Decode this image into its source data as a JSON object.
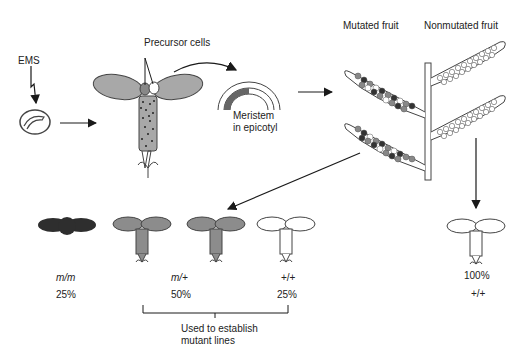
{
  "labels": {
    "ems": "EMS",
    "precursor_cells": "Precursor cells",
    "meristem_line1": "Meristem",
    "meristem_line2": "in epicotyl",
    "mutated_fruit": "Mutated fruit",
    "nonmutated_fruit": "Nonmutated fruit",
    "bracket_line1": "Used to establish",
    "bracket_line2": "mutant lines"
  },
  "offspring_mutated": [
    {
      "genotype": "m/m",
      "percent": "25%",
      "color": "#2e2e2e"
    },
    {
      "genotype": "m/+",
      "percent": "50%",
      "color": "#8c8c8c"
    },
    {
      "genotype": "+/+",
      "percent": "25%",
      "color": "#ffffff"
    }
  ],
  "offspring_nonmutated": {
    "genotype": "+/+",
    "percent": "100%",
    "color": "#ffffff"
  },
  "colors": {
    "dark": "#2e2e2e",
    "medium": "#8c8c8c",
    "light_fill": "#a8a8a8",
    "line": "#1a1a1a"
  }
}
